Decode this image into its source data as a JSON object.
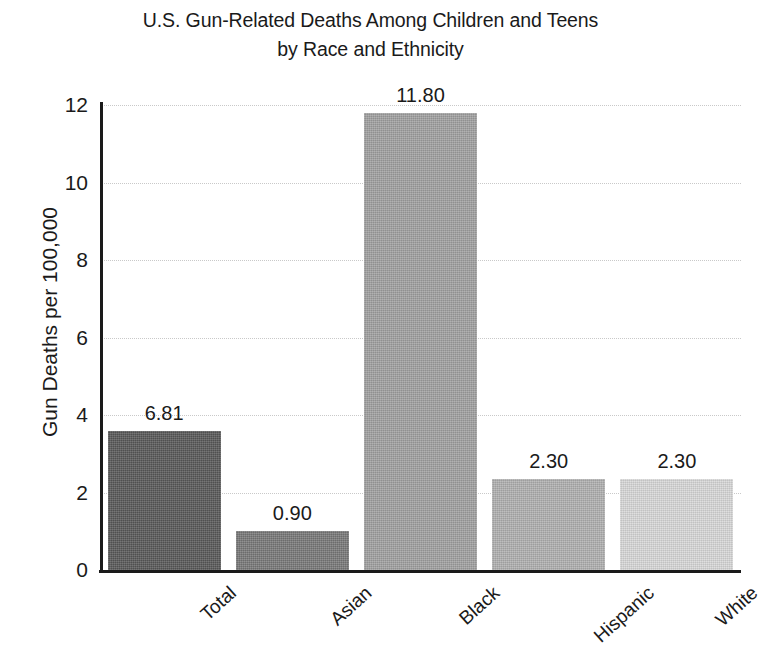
{
  "chart_data": {
    "type": "bar",
    "title": "U.S. Gun-Related Deaths Among Children and Teens by Race and Ethnicity",
    "title_lines": [
      "U.S. Gun-Related Deaths Among Children and Teens",
      "by Race and Ethnicity"
    ],
    "xlabel": "",
    "ylabel": "Gun Deaths per 100,000",
    "categories": [
      "Total",
      "Asian",
      "Black",
      "Hispanic",
      "White"
    ],
    "values": [
      6.81,
      0.9,
      11.8,
      2.3,
      2.3
    ],
    "data_labels": [
      "6.81",
      "0.90",
      "11.80",
      "2.30",
      "2.30"
    ],
    "bar_drawn_heights": [
      3.6,
      1.0,
      11.8,
      2.35,
      2.35
    ],
    "bar_colors": [
      "#595959",
      "#787878",
      "#a0a0a0",
      "#b0b0b0",
      "#d8d8d8"
    ],
    "ylim": [
      0,
      12
    ],
    "yticks": [
      0,
      2,
      4,
      6,
      8,
      10,
      12
    ],
    "ytick_labels": [
      "0",
      "2",
      "4",
      "6",
      "8",
      "10",
      "12"
    ],
    "grid": true,
    "grid_axis": "y",
    "grid_style": "dotted",
    "grid_color": "#c9c9c9",
    "legend": false,
    "legend_position": "none",
    "axis_color": "#1a1a1a",
    "background_color": "#ffffff",
    "xtick_label_rotation": -42
  }
}
